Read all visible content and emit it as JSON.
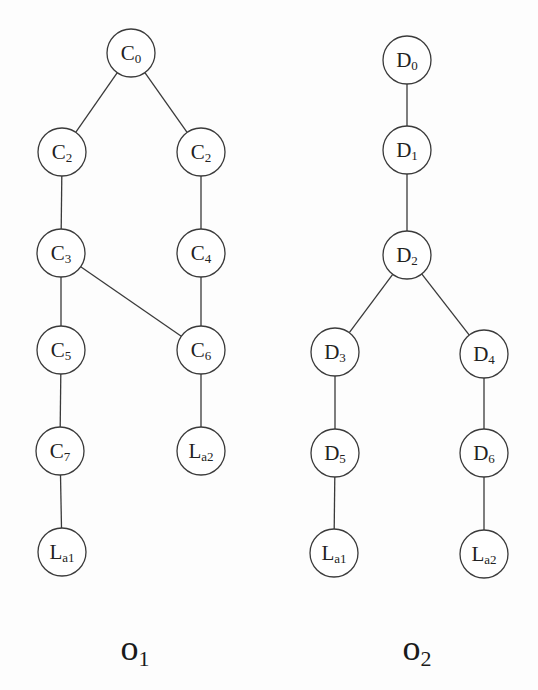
{
  "figure": {
    "width": 538,
    "height": 690,
    "node_radius": 24,
    "colors": {
      "stroke": "#3a3a3a",
      "text": "#222222",
      "background": "#fdfdfd"
    }
  },
  "trees": [
    {
      "id": "O1",
      "title": {
        "base": "o",
        "sub": "1",
        "x": 135,
        "y": 660
      },
      "nodes": [
        {
          "id": "c0",
          "base": "C",
          "sub": "0",
          "x": 131,
          "y": 53
        },
        {
          "id": "c2a",
          "base": "C",
          "sub": "2",
          "x": 62,
          "y": 152
        },
        {
          "id": "c2b",
          "base": "C",
          "sub": "2",
          "x": 201,
          "y": 152
        },
        {
          "id": "c3",
          "base": "C",
          "sub": "3",
          "x": 61,
          "y": 253
        },
        {
          "id": "c4",
          "base": "C",
          "sub": "4",
          "x": 201,
          "y": 253
        },
        {
          "id": "c5",
          "base": "C",
          "sub": "5",
          "x": 61,
          "y": 350
        },
        {
          "id": "c6",
          "base": "C",
          "sub": "6",
          "x": 201,
          "y": 350
        },
        {
          "id": "c7",
          "base": "C",
          "sub": "7",
          "x": 60,
          "y": 451
        },
        {
          "id": "la2",
          "base": "L",
          "sub": "a2",
          "x": 201,
          "y": 451
        },
        {
          "id": "la1",
          "base": "L",
          "sub": "a1",
          "x": 62,
          "y": 552
        }
      ],
      "edges": [
        [
          "c0",
          "c2a"
        ],
        [
          "c0",
          "c2b"
        ],
        [
          "c2a",
          "c3"
        ],
        [
          "c2b",
          "c4"
        ],
        [
          "c3",
          "c5"
        ],
        [
          "c3",
          "c6"
        ],
        [
          "c4",
          "c6"
        ],
        [
          "c5",
          "c7"
        ],
        [
          "c6",
          "la2"
        ],
        [
          "c7",
          "la1"
        ]
      ]
    },
    {
      "id": "O2",
      "title": {
        "base": "o",
        "sub": "2",
        "x": 417,
        "y": 660
      },
      "nodes": [
        {
          "id": "d0",
          "base": "D",
          "sub": "0",
          "x": 407,
          "y": 60
        },
        {
          "id": "d1",
          "base": "D",
          "sub": "1",
          "x": 407,
          "y": 150
        },
        {
          "id": "d2",
          "base": "D",
          "sub": "2",
          "x": 407,
          "y": 255
        },
        {
          "id": "d3",
          "base": "D",
          "sub": "3",
          "x": 335,
          "y": 352
        },
        {
          "id": "d4",
          "base": "D",
          "sub": "4",
          "x": 484,
          "y": 354
        },
        {
          "id": "d5",
          "base": "D",
          "sub": "5",
          "x": 335,
          "y": 453
        },
        {
          "id": "d6",
          "base": "D",
          "sub": "6",
          "x": 484,
          "y": 453
        },
        {
          "id": "la1",
          "base": "L",
          "sub": "a1",
          "x": 334,
          "y": 553
        },
        {
          "id": "la2",
          "base": "L",
          "sub": "a2",
          "x": 484,
          "y": 554
        }
      ],
      "edges": [
        [
          "d0",
          "d1"
        ],
        [
          "d1",
          "d2"
        ],
        [
          "d2",
          "d3"
        ],
        [
          "d2",
          "d4"
        ],
        [
          "d3",
          "d5"
        ],
        [
          "d4",
          "d6"
        ],
        [
          "d5",
          "la1"
        ],
        [
          "d6",
          "la2"
        ]
      ]
    }
  ]
}
